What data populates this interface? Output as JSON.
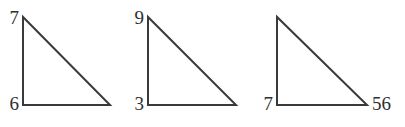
{
  "figure": {
    "background_color": "#ffffff",
    "stroke_color": "#3a3a3a",
    "text_color": "#2f2f2f",
    "stroke_width": 2,
    "width": 405,
    "height": 127,
    "triangles": [
      {
        "name": "triangle-1",
        "apex": {
          "x": 23,
          "y": 17
        },
        "bottom_left": {
          "x": 23,
          "y": 105
        },
        "bottom_right": {
          "x": 110,
          "y": 105
        },
        "labels": {
          "apex": "7",
          "bottom_left": "6",
          "bottom_right": ""
        }
      },
      {
        "name": "triangle-2",
        "apex": {
          "x": 148,
          "y": 17
        },
        "bottom_left": {
          "x": 148,
          "y": 105
        },
        "bottom_right": {
          "x": 236,
          "y": 105
        },
        "labels": {
          "apex": "9",
          "bottom_left": "3",
          "bottom_right": ""
        }
      },
      {
        "name": "triangle-3",
        "apex": {
          "x": 277,
          "y": 17
        },
        "bottom_left": {
          "x": 277,
          "y": 105
        },
        "bottom_right": {
          "x": 367,
          "y": 105
        },
        "labels": {
          "apex": "",
          "bottom_left": "7",
          "bottom_right": "56"
        }
      }
    ]
  }
}
